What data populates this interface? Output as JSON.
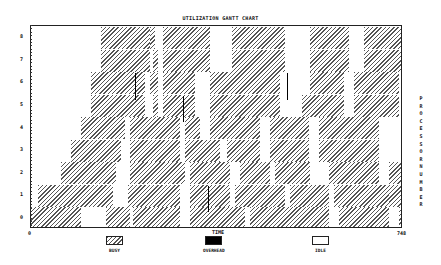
{
  "chart_data": {
    "type": "gantt",
    "title": "UTILIZATION GANTT CHART",
    "xlabel": "TIME",
    "ylabel": "PROCESSOR NUMBER",
    "xlim": [
      0,
      748
    ],
    "ylim": [
      0,
      8
    ],
    "x_tick_labels": [
      "0",
      "748"
    ],
    "y_tick_labels": [
      "0",
      "1",
      "2",
      "3",
      "4",
      "5",
      "6",
      "7",
      "8"
    ],
    "legend": [
      {
        "label": "BUSY",
        "pattern": "diagonal-hatch"
      },
      {
        "label": "OVERHEAD",
        "pattern": "solid-black"
      },
      {
        "label": "IDLE",
        "pattern": "white"
      }
    ],
    "rows": [
      {
        "processor": 8,
        "busy": [
          [
            140,
            240
          ],
          [
            240,
            250
          ],
          [
            265,
            360
          ],
          [
            405,
            510
          ],
          [
            560,
            640
          ],
          [
            670,
            760
          ]
        ]
      },
      {
        "processor": 7,
        "busy": [
          [
            140,
            240
          ],
          [
            245,
            255
          ],
          [
            265,
            360
          ],
          [
            405,
            510
          ],
          [
            560,
            640
          ],
          [
            670,
            760
          ]
        ]
      },
      {
        "processor": 6,
        "busy": [
          [
            120,
            230
          ],
          [
            240,
            255
          ],
          [
            265,
            330
          ],
          [
            360,
            500
          ],
          [
            560,
            630
          ],
          [
            650,
            740
          ]
        ]
      },
      {
        "processor": 5,
        "busy": [
          [
            120,
            230
          ],
          [
            245,
            255
          ],
          [
            265,
            330
          ],
          [
            360,
            500
          ],
          [
            545,
            630
          ],
          [
            650,
            740
          ]
        ]
      },
      {
        "processor": 4,
        "busy": [
          [
            100,
            190
          ],
          [
            200,
            300
          ],
          [
            310,
            340
          ],
          [
            360,
            460
          ],
          [
            480,
            560
          ],
          [
            580,
            700
          ]
        ]
      },
      {
        "processor": 3,
        "busy": [
          [
            80,
            180
          ],
          [
            200,
            300
          ],
          [
            310,
            380
          ],
          [
            395,
            460
          ],
          [
            480,
            560
          ],
          [
            580,
            700
          ],
          [
            745,
            848
          ]
        ]
      },
      {
        "processor": 2,
        "busy": [
          [
            60,
            170
          ],
          [
            200,
            310
          ],
          [
            320,
            400
          ],
          [
            420,
            480
          ],
          [
            490,
            560
          ],
          [
            600,
            700
          ],
          [
            720,
            800
          ]
        ]
      },
      {
        "processor": 1,
        "busy": [
          [
            15,
            165
          ],
          [
            195,
            300
          ],
          [
            320,
            400
          ],
          [
            410,
            510
          ],
          [
            520,
            600
          ],
          [
            610,
            720
          ],
          [
            720,
            780
          ]
        ]
      },
      {
        "processor": 0,
        "busy": [
          [
            0,
            100
          ],
          [
            150,
            200
          ],
          [
            205,
            300
          ],
          [
            320,
            430
          ],
          [
            440,
            600
          ],
          [
            620,
            720
          ],
          [
            740,
            800
          ]
        ]
      }
    ],
    "overhead_marks": [
      {
        "processor": 6,
        "time": 210
      },
      {
        "processor": 5,
        "time": 305
      },
      {
        "processor": 6,
        "time": 515
      },
      {
        "processor": 1,
        "time": 355
      }
    ]
  }
}
